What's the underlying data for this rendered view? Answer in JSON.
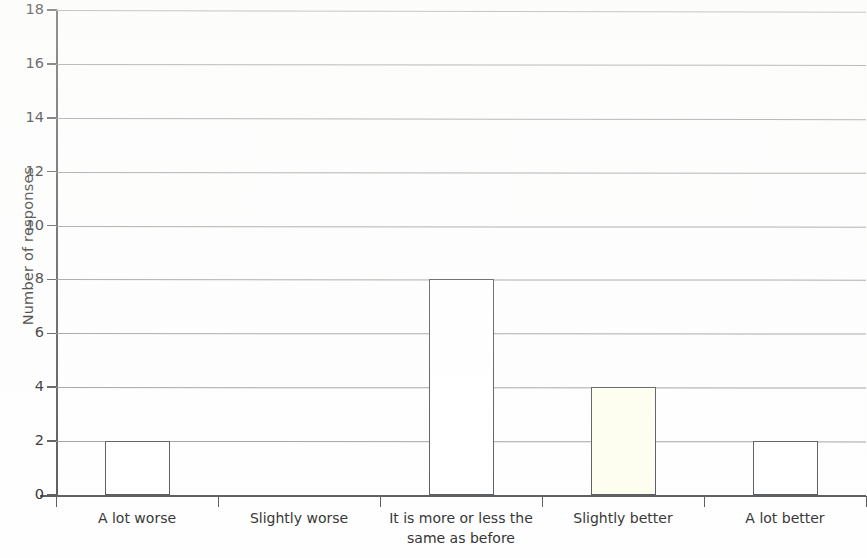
{
  "chart_data": {
    "type": "bar",
    "title": "",
    "subtitle": "",
    "xlabel": "",
    "ylabel": "Number of responses",
    "categories": [
      "A lot worse",
      "Slightly worse",
      "It is more or less the same as before",
      "Slightly better",
      "A lot better"
    ],
    "category_lines": [
      [
        "A lot worse"
      ],
      [
        "Slightly worse"
      ],
      [
        "It is more or less the",
        "same as before"
      ],
      [
        "Slightly better"
      ],
      [
        "A lot better"
      ]
    ],
    "values": [
      2,
      0,
      8,
      4,
      2
    ],
    "ylim": [
      0,
      18
    ],
    "ytick_labels": [
      "0",
      "2",
      "4",
      "6",
      "8",
      "10",
      "12",
      "14",
      "16",
      "18"
    ],
    "ytick_values": [
      0,
      2,
      4,
      6,
      8,
      10,
      12,
      14,
      16,
      18
    ],
    "ytick_step": 2,
    "grid": true,
    "grid_axis": "y",
    "legend": false,
    "legend_position": "none",
    "bar_colors": [
      "#ffffff",
      "#ffffff",
      "#ffffff",
      "#fefef0",
      "#ffffff"
    ],
    "bar_border_color": "#555a60",
    "grid_color": "#8f8f8f",
    "axis_color": "#5a5a5a",
    "background_color": "#fefefe",
    "annotations": []
  }
}
